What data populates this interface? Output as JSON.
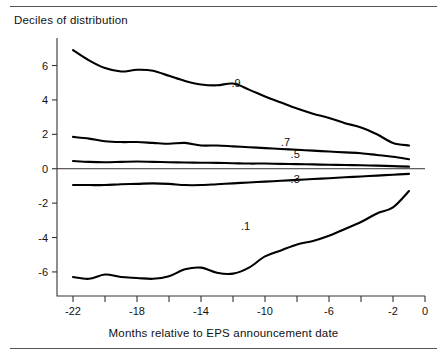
{
  "chart_title": "Deciles of distribution",
  "xaxis_title": "Months relative to EPS announcement date",
  "chart_data": {
    "type": "line",
    "title": "Deciles of distribution",
    "xlabel": "Months relative to EPS announcement date",
    "ylabel": "",
    "xlim": [
      -23,
      0
    ],
    "ylim": [
      -7.4,
      7.6
    ],
    "grid": false,
    "legend": "inline-labels",
    "x_major_ticks": [
      -22,
      -18,
      -14,
      -10,
      -6,
      -2,
      0
    ],
    "x_major_tick_labels": [
      "-22",
      "-18",
      "-14",
      "-10",
      "-6",
      "-2",
      "0"
    ],
    "x_minor_ticks": [
      -20,
      -16,
      -12,
      -8,
      -4
    ],
    "y_ticks": [
      6,
      4,
      2,
      0,
      -2,
      -4,
      -6
    ],
    "y_tick_labels": [
      "6",
      "4",
      "2",
      "0",
      "-2",
      "-4",
      "-6"
    ],
    "zero_line": 0,
    "x": [
      -22,
      -21,
      -20,
      -19,
      -18,
      -17,
      -16,
      -15,
      -14,
      -13,
      -12,
      -11,
      -10,
      -9,
      -8,
      -7,
      -6,
      -5,
      -4,
      -3,
      -2,
      -1
    ],
    "series": [
      {
        "name": ".9",
        "label": ".9",
        "label_x": -12.1,
        "label_y": 4.75,
        "values": [
          6.9,
          6.3,
          5.85,
          5.65,
          5.75,
          5.7,
          5.4,
          5.1,
          4.9,
          4.85,
          4.95,
          4.6,
          4.2,
          3.85,
          3.5,
          3.2,
          2.95,
          2.65,
          2.4,
          2.0,
          1.5,
          1.35
        ]
      },
      {
        "name": ".7",
        "label": ".7",
        "label_x": -9.0,
        "label_y": 1.35,
        "values": [
          1.85,
          1.75,
          1.6,
          1.55,
          1.55,
          1.5,
          1.45,
          1.5,
          1.35,
          1.35,
          1.3,
          1.25,
          1.2,
          1.15,
          1.1,
          1.05,
          1.0,
          0.95,
          0.9,
          0.8,
          0.7,
          0.55
        ]
      },
      {
        "name": ".5",
        "label": ".5",
        "label_x": -8.4,
        "label_y": 0.62,
        "values": [
          0.45,
          0.4,
          0.38,
          0.4,
          0.42,
          0.4,
          0.38,
          0.36,
          0.35,
          0.34,
          0.32,
          0.3,
          0.3,
          0.28,
          0.27,
          0.25,
          0.23,
          0.22,
          0.2,
          0.18,
          0.15,
          0.12
        ]
      },
      {
        "name": ".3",
        "label": ".3",
        "label_x": -8.4,
        "label_y": -0.85,
        "values": [
          -0.95,
          -0.95,
          -0.95,
          -0.9,
          -0.88,
          -0.85,
          -0.88,
          -0.95,
          -0.95,
          -0.9,
          -0.85,
          -0.8,
          -0.75,
          -0.7,
          -0.65,
          -0.6,
          -0.55,
          -0.5,
          -0.45,
          -0.4,
          -0.35,
          -0.3
        ]
      },
      {
        "name": ".1",
        "label": ".1",
        "label_x": -11.5,
        "label_y": -3.55,
        "values": [
          -6.3,
          -6.4,
          -6.15,
          -6.3,
          -6.35,
          -6.4,
          -6.25,
          -5.85,
          -5.75,
          -6.05,
          -6.1,
          -5.75,
          -5.1,
          -4.75,
          -4.4,
          -4.2,
          -3.9,
          -3.5,
          -3.1,
          -2.6,
          -2.25,
          -1.3
        ]
      }
    ]
  }
}
